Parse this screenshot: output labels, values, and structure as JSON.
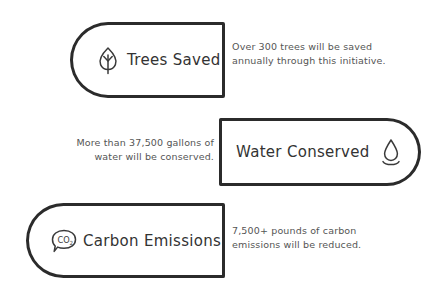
{
  "theme": {
    "background": "#ffffff",
    "stroke": "#2b2b2b",
    "label_color": "#333333",
    "body_color": "#555555"
  },
  "rows": [
    {
      "id": "trees",
      "icon": "leaf-icon",
      "label": "Trees Saved",
      "badge_side": "left",
      "description_lines": [
        "Over 300 trees will be saved",
        "annually through this initiative."
      ]
    },
    {
      "id": "water",
      "icon": "water-drop-icon",
      "label": "Water Conserved",
      "badge_side": "right",
      "description_lines": [
        "More than 37,500 gallons of",
        "water will be conserved."
      ]
    },
    {
      "id": "carbon",
      "icon": "co2-bubble-icon",
      "label": "Carbon Emissions",
      "badge_side": "left",
      "description_lines": [
        "7,500+ pounds of carbon",
        "emissions will be reduced."
      ]
    }
  ]
}
